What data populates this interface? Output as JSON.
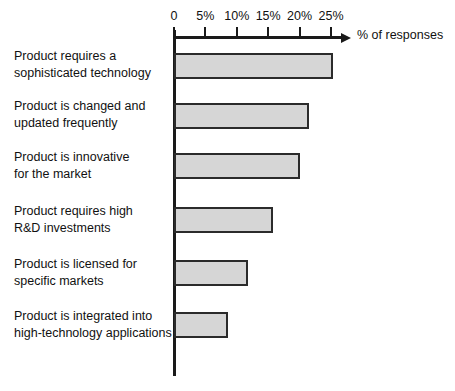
{
  "chart": {
    "type": "bar",
    "orientation": "horizontal",
    "axis_title": "% of responses",
    "tick_labels": [
      "0",
      "5%",
      "10%",
      "15%",
      "20%",
      "25%"
    ],
    "tick_values": [
      0,
      5,
      10,
      15,
      20,
      25
    ],
    "colors": {
      "bar_fill": "#d6d6d6",
      "bar_stroke": "#2b2b2b",
      "axis": "#1a1a1a",
      "text": "#111111",
      "background": "#ffffff"
    }
  },
  "chart_data": {
    "type": "bar",
    "title": "",
    "subtitle": "",
    "xlabel": "% of responses",
    "ylabel": "",
    "orientation": "horizontal",
    "grid": false,
    "legend": false,
    "xlim": [
      0,
      27
    ],
    "xticks": [
      0,
      5,
      10,
      15,
      20,
      25
    ],
    "xtick_labels": [
      "0",
      "5%",
      "10%",
      "15%",
      "20%",
      "25%"
    ],
    "categories": [
      "Product requires a sophisticated technology",
      "Product is changed and updated frequently",
      "Product is innovative for the market",
      "Product requires high R&D investments",
      "Product is licensed for specific markets",
      "Product is integrated into high-technology applications"
    ],
    "category_lines": [
      [
        "Product requires a",
        "sophisticated technology"
      ],
      [
        "Product is changed and",
        "updated frequently"
      ],
      [
        "Product is innovative",
        "for the market"
      ],
      [
        "Product requires high",
        "R&D investments"
      ],
      [
        "Product is licensed for",
        "specific markets"
      ],
      [
        "Product is integrated into",
        "high-technology applications"
      ]
    ],
    "values": [
      25.3,
      21.5,
      20.0,
      15.8,
      11.8,
      8.6
    ],
    "units": "percent"
  },
  "labels": {
    "cat0": "Product requires a\nsophisticated technology",
    "cat1": "Product is changed and\nupdated frequently",
    "cat2": "Product is innovative\nfor the market",
    "cat3": "Product requires high\nR&D investments",
    "cat4": "Product is licensed for\nspecific markets",
    "cat5": "Product is integrated into\nhigh-technology applications"
  }
}
